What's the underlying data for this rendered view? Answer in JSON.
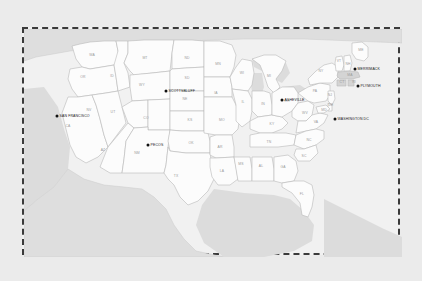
{
  "map": {
    "title": "United States Map",
    "background_color": "#ebebeb",
    "frame_color": "#3a3a3a",
    "land_color": "#fcfcfc",
    "border_color": "#b9b9b9",
    "water_color": "#dcdcdc",
    "neighbor_color": "#dedede",
    "highlight_color": "#d4d4d4",
    "label_color": "#9a9a9a",
    "city_label_color": "#1a1a1a",
    "states": [
      {
        "abbr": "WA",
        "x": 68,
        "y": 27,
        "highlight": false
      },
      {
        "abbr": "OR",
        "x": 59,
        "y": 49,
        "highlight": false
      },
      {
        "abbr": "CA",
        "x": 44,
        "y": 98,
        "highlight": false
      },
      {
        "abbr": "NV",
        "x": 65,
        "y": 82,
        "highlight": false
      },
      {
        "abbr": "ID",
        "x": 88,
        "y": 48,
        "highlight": false
      },
      {
        "abbr": "MT",
        "x": 121,
        "y": 30,
        "highlight": false
      },
      {
        "abbr": "WY",
        "x": 118,
        "y": 57,
        "highlight": false
      },
      {
        "abbr": "UT",
        "x": 89,
        "y": 84,
        "highlight": false
      },
      {
        "abbr": "AZ",
        "x": 79,
        "y": 122,
        "highlight": false
      },
      {
        "abbr": "CO",
        "x": 122,
        "y": 90,
        "highlight": false
      },
      {
        "abbr": "NM",
        "x": 113,
        "y": 125,
        "highlight": false
      },
      {
        "abbr": "ND",
        "x": 163,
        "y": 30,
        "highlight": false
      },
      {
        "abbr": "SD",
        "x": 163,
        "y": 50,
        "highlight": false
      },
      {
        "abbr": "NE",
        "x": 161,
        "y": 71,
        "highlight": false
      },
      {
        "abbr": "KS",
        "x": 166,
        "y": 92,
        "highlight": false
      },
      {
        "abbr": "OK",
        "x": 167,
        "y": 115,
        "highlight": false
      },
      {
        "abbr": "TX",
        "x": 152,
        "y": 148,
        "highlight": false
      },
      {
        "abbr": "MN",
        "x": 194,
        "y": 36,
        "highlight": false
      },
      {
        "abbr": "IA",
        "x": 192,
        "y": 65,
        "highlight": false
      },
      {
        "abbr": "MO",
        "x": 198,
        "y": 92,
        "highlight": false
      },
      {
        "abbr": "AR",
        "x": 196,
        "y": 119,
        "highlight": false
      },
      {
        "abbr": "LA",
        "x": 198,
        "y": 143,
        "highlight": false
      },
      {
        "abbr": "WI",
        "x": 218,
        "y": 45,
        "highlight": false
      },
      {
        "abbr": "IL",
        "x": 219,
        "y": 74,
        "highlight": false
      },
      {
        "abbr": "MS",
        "x": 217,
        "y": 136,
        "highlight": false
      },
      {
        "abbr": "MI",
        "x": 245,
        "y": 48,
        "highlight": false
      },
      {
        "abbr": "IN",
        "x": 239,
        "y": 76,
        "highlight": false
      },
      {
        "abbr": "KY",
        "x": 248,
        "y": 96,
        "highlight": false
      },
      {
        "abbr": "TN",
        "x": 245,
        "y": 114,
        "highlight": false
      },
      {
        "abbr": "AL",
        "x": 237,
        "y": 138,
        "highlight": false
      },
      {
        "abbr": "GA",
        "x": 259,
        "y": 139,
        "highlight": false
      },
      {
        "abbr": "FL",
        "x": 278,
        "y": 166,
        "highlight": false
      },
      {
        "abbr": "OH",
        "x": 263,
        "y": 73,
        "highlight": false
      },
      {
        "abbr": "WV",
        "x": 281,
        "y": 85,
        "highlight": false
      },
      {
        "abbr": "VA",
        "x": 292,
        "y": 94,
        "highlight": false
      },
      {
        "abbr": "NC",
        "x": 285,
        "y": 112,
        "highlight": false
      },
      {
        "abbr": "SC",
        "x": 280,
        "y": 128,
        "highlight": false
      },
      {
        "abbr": "PA",
        "x": 291,
        "y": 63,
        "highlight": false
      },
      {
        "abbr": "NY",
        "x": 297,
        "y": 43,
        "highlight": false
      },
      {
        "abbr": "ME",
        "x": 337,
        "y": 22,
        "highlight": false
      },
      {
        "abbr": "VT",
        "x": 315,
        "y": 33,
        "highlight": false
      },
      {
        "abbr": "NH",
        "x": 324,
        "y": 36,
        "highlight": false
      },
      {
        "abbr": "MA",
        "x": 326,
        "y": 47,
        "highlight": true
      },
      {
        "abbr": "CT",
        "x": 318,
        "y": 54,
        "highlight": true
      },
      {
        "abbr": "RI",
        "x": 330,
        "y": 54,
        "highlight": true
      },
      {
        "abbr": "NJ",
        "x": 306,
        "y": 67,
        "highlight": false
      },
      {
        "abbr": "DE",
        "x": 307,
        "y": 77,
        "highlight": false
      },
      {
        "abbr": "MD",
        "x": 300,
        "y": 82,
        "highlight": false
      }
    ],
    "cities": [
      {
        "name": "SAN FRANCISCO",
        "x": 33,
        "y": 87,
        "anchor": "start"
      },
      {
        "name": "PECOS",
        "x": 124,
        "y": 116,
        "anchor": "start"
      },
      {
        "name": "SCOTTSBLUFF",
        "x": 142,
        "y": 62,
        "anchor": "start"
      },
      {
        "name": "ASHEVILLE",
        "x": 258,
        "y": 71,
        "anchor": "start"
      },
      {
        "name": "WASHINGTON DC",
        "x": 311,
        "y": 90,
        "anchor": "start"
      },
      {
        "name": "MERRIMACK",
        "x": 331,
        "y": 40,
        "anchor": "start"
      },
      {
        "name": "PLYMOUTH",
        "x": 334,
        "y": 57,
        "anchor": "start"
      }
    ]
  }
}
